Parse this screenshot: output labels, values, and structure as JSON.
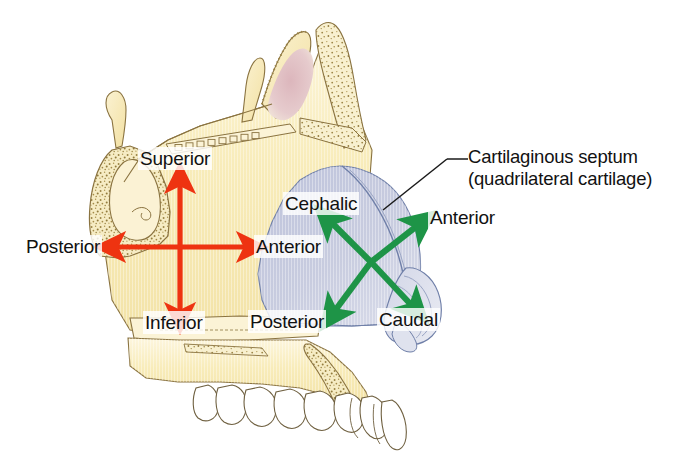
{
  "figure": {
    "colors": {
      "background": "#ffffff",
      "bone": "#f7ebb8",
      "bone_light": "#fbf3d6",
      "bone_outline": "#8a7340",
      "cartilage": "#c3c8dd",
      "cartilage_outline": "#6f7fa8",
      "sinus_pink": "#e0c0c4",
      "tooth": "#ffffff",
      "tooth_outline": "#7a6a4a",
      "arrow_red": "#ee3311",
      "arrow_green": "#1e9447",
      "text": "#111111"
    }
  },
  "labels": {
    "superior": "Superior",
    "inferior": "Inferior",
    "posterior_red": "Posterior",
    "anterior_red": "Anterior",
    "cephalic": "Cephalic",
    "caudal": "Caudal",
    "anterior_green": "Anterior",
    "posterior_green": "Posterior"
  },
  "callout": {
    "line1": "Cartilaginous septum",
    "line2": "(quadrilateral cartilage)"
  },
  "axes": {
    "bony_septum": {
      "color": "#ee3311",
      "directions": [
        "Superior",
        "Inferior",
        "Anterior",
        "Posterior"
      ]
    },
    "cartilaginous_septum": {
      "color": "#1e9447",
      "directions": [
        "Cephalic",
        "Caudal",
        "Anterior",
        "Posterior"
      ]
    }
  }
}
